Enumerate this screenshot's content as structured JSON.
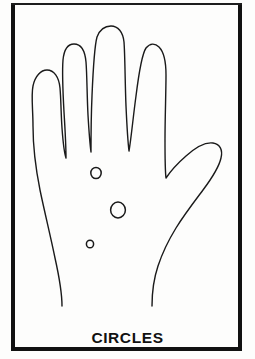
{
  "figure": {
    "caption": "CIRCLES",
    "colors": {
      "background": "#fdfdfc",
      "ink": "#1a1a1a",
      "border": "#111111",
      "caption": "#111111"
    },
    "frame": {
      "name": "page-border",
      "x": 11,
      "y": 3,
      "width": 231,
      "height": 348,
      "side_stroke": 4,
      "top_stroke": 2,
      "bottom_stroke": 4
    },
    "hand": {
      "name": "hand-outline",
      "stroke_width": 1.4,
      "fingers": [
        {
          "name": "pinky-finger",
          "tip_x": 43,
          "tip_y": 75
        },
        {
          "name": "ring-finger",
          "tip_x": 73,
          "tip_y": 45
        },
        {
          "name": "middle-finger",
          "tip_x": 118,
          "tip_y": 28
        },
        {
          "name": "index-finger",
          "tip_x": 160,
          "tip_y": 47
        },
        {
          "name": "thumb",
          "tip_x": 218,
          "tip_y": 146
        }
      ],
      "wrist": {
        "left_x": 62,
        "right_x": 166,
        "y": 306
      }
    },
    "circles": [
      {
        "name": "palm-circle-upper",
        "cx": 96,
        "cy": 173,
        "r": 5.2
      },
      {
        "name": "palm-circle-middle",
        "cx": 118,
        "cy": 210,
        "r": 7.4
      },
      {
        "name": "palm-circle-lower",
        "cx": 90,
        "cy": 244,
        "r": 3.6
      }
    ]
  },
  "chart_data": {
    "type": "table",
    "title": "CIRCLES",
    "xlabel": "",
    "ylabel": "",
    "categories": [
      "palm-circle-upper",
      "palm-circle-middle",
      "palm-circle-lower"
    ],
    "values": [
      5.2,
      7.4,
      3.6
    ],
    "annotations": [
      "CIRCLES"
    ]
  }
}
